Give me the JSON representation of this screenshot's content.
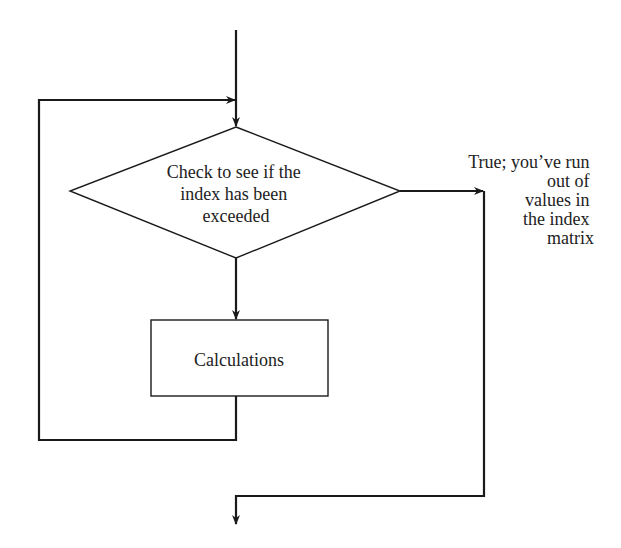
{
  "diagram": {
    "type": "flowchart",
    "colors": {
      "line": "#1a1a1a",
      "text": "#222222",
      "background": "#ffffff"
    },
    "decision": {
      "lines": [
        "Check to see if the",
        "index has been",
        "exceeded"
      ]
    },
    "process": {
      "label": "Calculations"
    },
    "true_branch": {
      "lines": [
        "True; you’ve run",
        "out of",
        "values in",
        "the index",
        "matrix"
      ]
    }
  }
}
